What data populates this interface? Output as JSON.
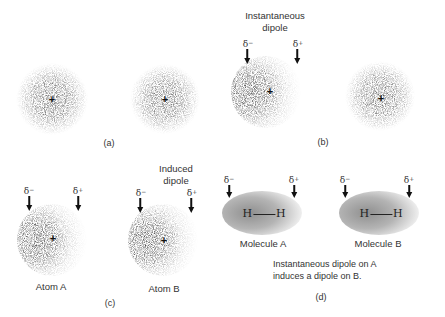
{
  "panels": {
    "a": {
      "label": "(a)",
      "atoms": [
        {
          "name": "atom-1",
          "nucleus": "+",
          "distortion": "none"
        },
        {
          "name": "atom-2",
          "nucleus": "+",
          "distortion": "none"
        }
      ]
    },
    "b": {
      "label": "(b)",
      "title_line1": "Instantaneous",
      "title_line2": "dipole",
      "delta_minus": "δ",
      "delta_minus_sign": "−",
      "delta_plus": "δ",
      "delta_plus_sign": "+",
      "atoms": [
        {
          "name": "atom-1",
          "nucleus": "+",
          "distortion": "left-dense"
        },
        {
          "name": "atom-2",
          "nucleus": "+",
          "distortion": "none"
        }
      ]
    },
    "c": {
      "label": "(c)",
      "title_line1": "Induced",
      "title_line2": "dipole",
      "delta_minus": "δ",
      "delta_minus_sign": "−",
      "delta_plus": "δ",
      "delta_plus_sign": "+",
      "atoms": [
        {
          "name": "atom-a",
          "caption": "Atom A",
          "nucleus": "+"
        },
        {
          "name": "atom-b",
          "caption": "Atom B",
          "nucleus": "+"
        }
      ]
    },
    "d": {
      "label": "(d)",
      "delta_minus": "δ",
      "delta_minus_sign": "−",
      "delta_plus": "δ",
      "delta_plus_sign": "+",
      "molecules": [
        {
          "caption": "Molecule A",
          "left_atom": "H",
          "right_atom": "H"
        },
        {
          "caption": "Molecule B",
          "left_atom": "H",
          "right_atom": "H"
        }
      ],
      "caption_line1": "Instantaneous dipole on A",
      "caption_line2": "induces a dipole on B."
    }
  },
  "colors": {
    "cloud_dense": "#6e6e6e",
    "cloud_light": "#d8d8d8",
    "ellipse_dense": "#9a9a9a",
    "ellipse_light": "#ebebeb",
    "text": "#333333",
    "arrow": "#111111"
  }
}
